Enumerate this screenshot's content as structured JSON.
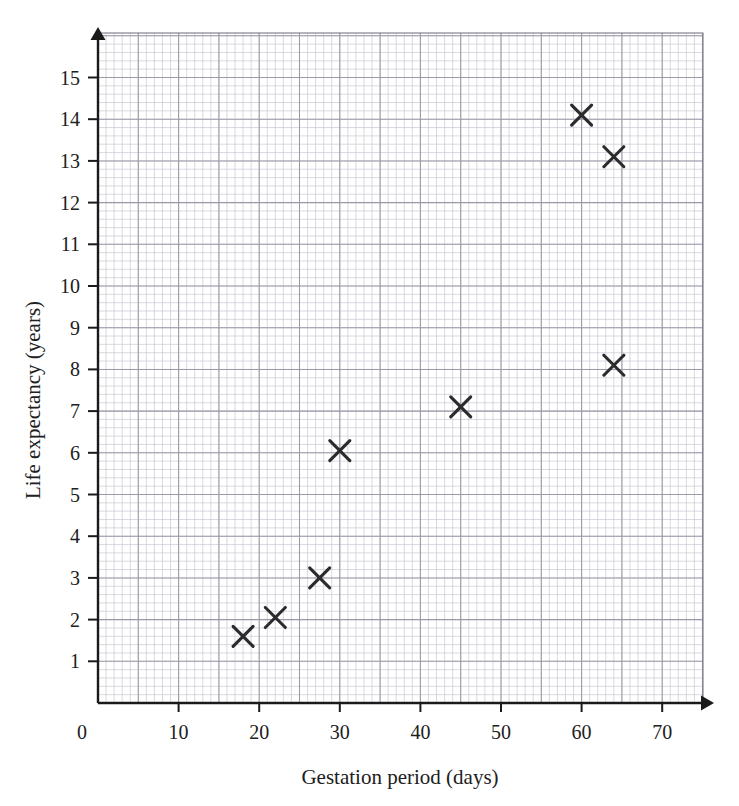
{
  "chart_data": {
    "type": "scatter",
    "title": "",
    "xlabel": "Gestation period (days)",
    "ylabel": "Life expectancy (years)",
    "xlim": [
      0,
      75
    ],
    "ylim": [
      0,
      15.8
    ],
    "xticks": [
      0,
      10,
      20,
      30,
      40,
      50,
      60,
      70
    ],
    "yticks": [
      1,
      2,
      3,
      4,
      5,
      6,
      7,
      8,
      9,
      10,
      11,
      12,
      13,
      14,
      15
    ],
    "xtick_labels": [
      "0",
      "10",
      "20",
      "30",
      "40",
      "50",
      "60",
      "70"
    ],
    "ytick_labels": [
      "1",
      "2",
      "3",
      "4",
      "5",
      "6",
      "7",
      "8",
      "9",
      "10",
      "11",
      "12",
      "13",
      "14",
      "15"
    ],
    "grid": true,
    "grid_minor_step_x": 1,
    "grid_minor_step_y": 0.2,
    "grid_major_step_x": 5,
    "grid_major_step_y": 1,
    "legend": false,
    "marker": "x-cross",
    "marker_color": "#2b2b2b",
    "grid_minor_color": "#c9c9d4",
    "grid_major_color": "#9a9aa8",
    "axis_color": "#1a1a1a",
    "points": [
      {
        "x": 18.0,
        "y": 1.6
      },
      {
        "x": 22.0,
        "y": 2.05
      },
      {
        "x": 27.5,
        "y": 3.0
      },
      {
        "x": 30.0,
        "y": 6.05
      },
      {
        "x": 45.0,
        "y": 7.1
      },
      {
        "x": 60.0,
        "y": 14.1
      },
      {
        "x": 64.0,
        "y": 13.1
      },
      {
        "x": 64.0,
        "y": 8.1
      }
    ],
    "x": [
      18.0,
      22.0,
      27.5,
      30.0,
      45.0,
      60.0,
      64.0,
      64.0
    ],
    "y": [
      1.6,
      2.05,
      3.0,
      6.05,
      7.1,
      14.1,
      13.1,
      8.1
    ]
  },
  "axes": {
    "x_axis_name": "x-axis",
    "y_axis_name": "y-axis",
    "origin_label": "0"
  }
}
